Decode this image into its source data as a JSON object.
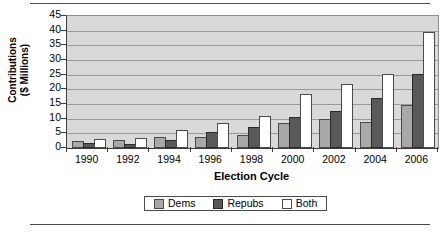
{
  "chart_data": {
    "type": "bar",
    "title": "",
    "xlabel": "Election Cycle",
    "ylabel": "Contributions\n($ Millions)",
    "categories": [
      "1990",
      "1992",
      "1994",
      "1996",
      "1998",
      "2000",
      "2002",
      "2004",
      "2006"
    ],
    "series": [
      {
        "name": "Dems",
        "color": "#a8a8a8",
        "values": [
          1.8,
          2.0,
          3.0,
          3.1,
          3.6,
          7.7,
          9.2,
          8.3,
          14.1
        ]
      },
      {
        "name": "Repubs",
        "color": "#595959",
        "values": [
          0.9,
          0.6,
          2.2,
          4.9,
          6.6,
          9.8,
          11.9,
          16.2,
          24.6
        ]
      },
      {
        "name": "Both",
        "color": "#ffffff",
        "values": [
          2.5,
          2.7,
          5.3,
          7.9,
          10.4,
          17.6,
          21.1,
          24.4,
          38.7
        ]
      }
    ],
    "ylim": [
      0,
      45
    ],
    "ytick_interval": 5,
    "yticks": [
      "45",
      "40",
      "35",
      "30",
      "25",
      "20",
      "15",
      "10",
      "5",
      "0"
    ],
    "grid": true,
    "legend_position": "bottom",
    "plot_background": "#d9d9d9"
  }
}
